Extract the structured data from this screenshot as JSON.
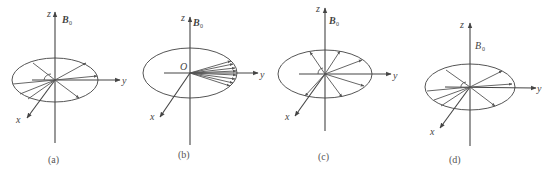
{
  "figure": {
    "panels": [
      {
        "id": "a",
        "caption": "(a)",
        "axes": {
          "z": "z",
          "y": "y",
          "x": "x"
        },
        "field_label": "B",
        "field_subscript": "0",
        "origin_label": "O",
        "description": "Spins spread uniformly in the xy-plane (dephased)"
      },
      {
        "id": "b",
        "caption": "(b)",
        "axes": {
          "z": "z",
          "y": "y",
          "x": "x"
        },
        "field_label": "B",
        "field_subscript": "0",
        "origin_label": "O",
        "description": "Spins in phase, fanned closely about the y-axis"
      },
      {
        "id": "c",
        "caption": "(c)",
        "axes": {
          "z": "z",
          "y": "y",
          "x": "x"
        },
        "field_label": "B",
        "field_subscript": "0",
        "origin_label": "O",
        "description": "Spins dephasing, spread around the xy-plane"
      },
      {
        "id": "d",
        "caption": "(d)",
        "axes": {
          "z": "z",
          "y": "y",
          "x": "x"
        },
        "field_label": "B",
        "field_subscript": "0",
        "origin_label": "O",
        "description": "Spins spread uniformly in the xy-plane (dephased)"
      }
    ],
    "colors": {
      "lines": "#444444",
      "text": "#444444",
      "background": "#ffffff"
    }
  }
}
